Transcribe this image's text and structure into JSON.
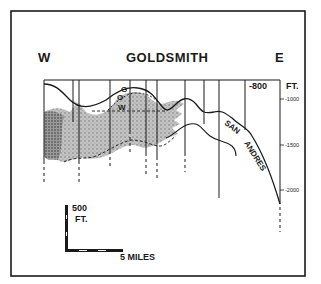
{
  "title": "GOLDSMITH",
  "direction_left": "W",
  "direction_right": "E",
  "unit_label": "FT.",
  "datum_label": "-800",
  "depth_ticks": [
    {
      "label": "-1000",
      "depth": -1000
    },
    {
      "label": "-1500",
      "depth": -1500
    },
    {
      "label": "-2000",
      "depth": -2000
    }
  ],
  "formation_label_1": "SAN",
  "formation_label_2": "ANDRES",
  "fluid_contacts": {
    "gas": "G",
    "oil": "O",
    "water": "W"
  },
  "scale_bar": {
    "vertical_value": "500",
    "vertical_unit": "FT.",
    "horizontal_label": "5 MILES"
  },
  "colors": {
    "ink": "#1a1a1a",
    "reservoir_fill": "#b8b8b8",
    "background": "#ffffff"
  }
}
